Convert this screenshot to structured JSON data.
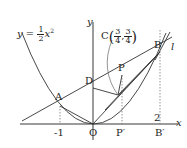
{
  "figure": {
    "curve_label": {
      "prefix": "y = ",
      "num": "1",
      "den": "2",
      "var": "x",
      "exp": "2"
    },
    "axes": {
      "x_label": "x",
      "y_label": "y",
      "origin_label": "O"
    },
    "points": {
      "A": "A",
      "B": "B",
      "D": "D",
      "P": "P",
      "P_prime": "P′",
      "B_prime": "B′"
    },
    "point_C": {
      "name": "C",
      "x_num": "3",
      "x_den": "4",
      "y_num": "3",
      "y_den": "4"
    },
    "line_label": "l",
    "tick_labels": {
      "minus_one": "-1",
      "two": "2"
    },
    "colors": {
      "ink": "#222222",
      "guide": "#666666"
    }
  }
}
